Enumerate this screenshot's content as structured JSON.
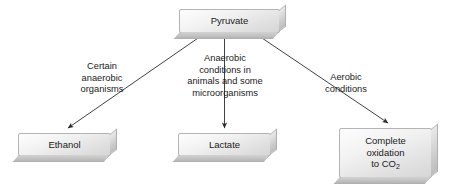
{
  "diagram": {
    "source_node": {
      "id": "pyruvate",
      "label": "Pyruvate"
    },
    "branches": [
      {
        "id": "ethanol-branch",
        "condition_lines": [
          "Certain",
          "anaerobic",
          "organisms"
        ],
        "product": "Ethanol",
        "arrow": "diagonal-down-left"
      },
      {
        "id": "lactate-branch",
        "condition_lines": [
          "Anaerobic",
          "conditions in",
          "animals and some",
          "microorganisms"
        ],
        "product": "Lactate",
        "arrow": "vertical-down"
      },
      {
        "id": "oxidation-branch",
        "condition_lines": [
          "Aerobic",
          "conditions"
        ],
        "product_lines": [
          "Complete",
          "oxidation",
          "to CO"
        ],
        "product_subscript": "2",
        "arrow": "diagonal-down-right"
      }
    ],
    "colors": {
      "background": "#ffffff",
      "box_face_light": "#fdfdfd",
      "box_face_dark": "#d6d6d6",
      "box_border": "#b4b4b4",
      "bevel_right": "#cfcfcf",
      "bevel_bottom": "#c2c2c2",
      "text": "#1b1b1b",
      "connector": "#2b2b2b"
    }
  }
}
